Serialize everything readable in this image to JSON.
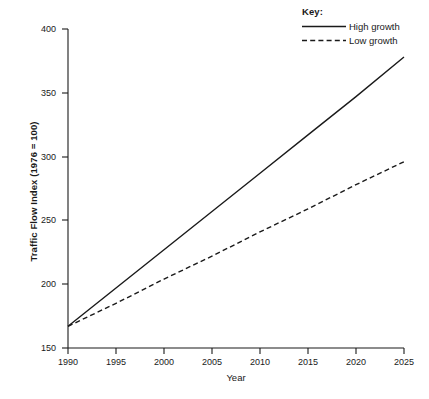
{
  "chart_data": {
    "type": "line",
    "title": "",
    "xlabel": "Year",
    "ylabel": "Traffic Flow Index (1976 = 100)",
    "xlim": [
      1990,
      2025
    ],
    "ylim": [
      150,
      400
    ],
    "xticks": [
      1990,
      1995,
      2000,
      2005,
      2010,
      2015,
      2020,
      2025
    ],
    "yticks": [
      150,
      200,
      250,
      300,
      350,
      400
    ],
    "grid": false,
    "legend_position": "top-right",
    "legend_title": "Key:",
    "x": [
      1990,
      1995,
      2000,
      2005,
      2010,
      2015,
      2020,
      2025
    ],
    "series": [
      {
        "name": "High growth",
        "style": "solid",
        "color": "#1a1a1a",
        "values": [
          167,
          197,
          227,
          257,
          287,
          317,
          347,
          378
        ]
      },
      {
        "name": "Low growth",
        "style": "dashed",
        "color": "#1a1a1a",
        "values": [
          167,
          185,
          204,
          222,
          241,
          259,
          278,
          296
        ]
      }
    ]
  },
  "axes": {
    "y_title": "Traffic Flow Index (1976 = 100)",
    "x_title": "Year",
    "y_tick_labels": [
      "400",
      "350",
      "300",
      "250",
      "200",
      "150"
    ],
    "x_tick_labels": [
      "1990",
      "1995",
      "2000",
      "2005",
      "2010",
      "2015",
      "2020",
      "2025"
    ]
  },
  "legend": {
    "title": "Key:",
    "items": [
      {
        "label": "High growth",
        "style": "solid"
      },
      {
        "label": "Low growth",
        "style": "dashed"
      }
    ]
  },
  "colors": {
    "ink": "#1a1a1a",
    "background": "#ffffff"
  }
}
